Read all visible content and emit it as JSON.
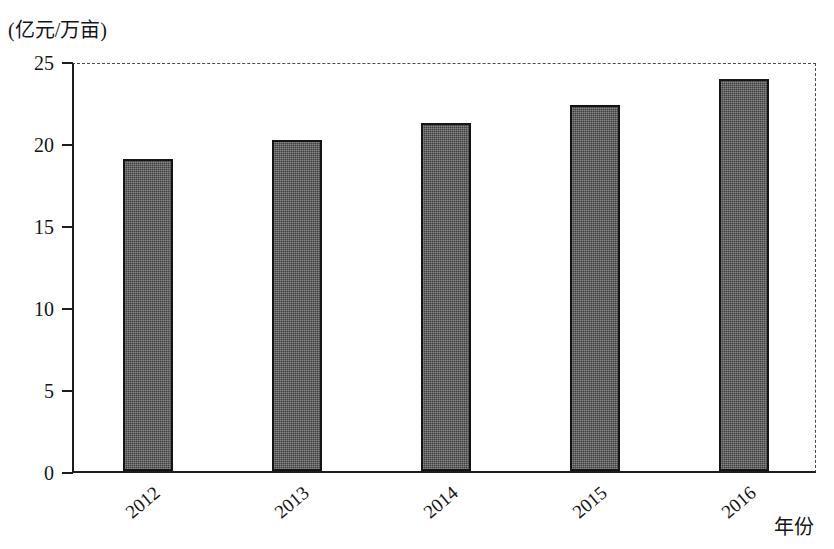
{
  "chart_data": {
    "type": "bar",
    "title": "",
    "subtitle": "",
    "unit_label": "(亿元/万亩)",
    "xlabel": "年份",
    "ylabel": "",
    "categories": [
      "2012",
      "2013",
      "2014",
      "2015",
      "2016"
    ],
    "values": [
      19.0,
      20.2,
      21.2,
      22.3,
      23.9
    ],
    "series": [
      {
        "name": "",
        "values": [
          19.0,
          20.2,
          21.2,
          22.3,
          23.9
        ]
      }
    ],
    "ylim": [
      0,
      25
    ],
    "ytick_labels": [
      "0",
      "5",
      "10",
      "15",
      "20",
      "25"
    ],
    "ytick_values": [
      0,
      5,
      10,
      15,
      20,
      25
    ],
    "grid": false,
    "legend": "none",
    "bar_color": "#565656",
    "bar_border_color": "#141414",
    "axis_color": "#1d1d1d",
    "frame_style": "dashed-top-right",
    "x_label_rotation_deg": -40
  }
}
